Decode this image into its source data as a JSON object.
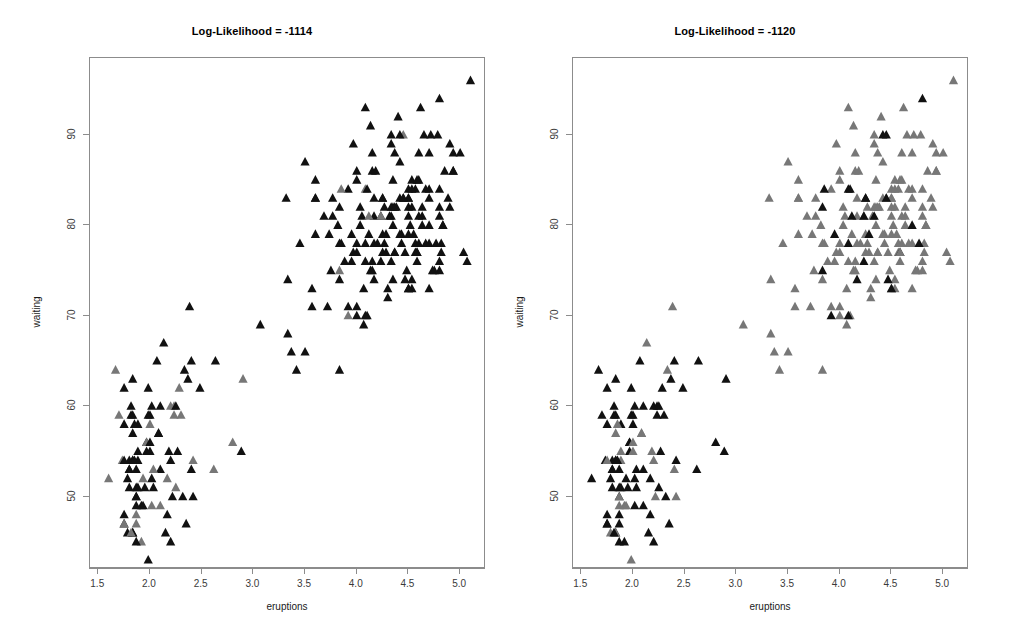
{
  "figure": {
    "width": 1009,
    "height": 643,
    "background": "#ffffff"
  },
  "panels": [
    {
      "id": "left",
      "title": "Log-Likelihood = -1114"
    },
    {
      "id": "right",
      "title": "Log-Likelihood = -1120"
    }
  ],
  "axes": {
    "xlabel": "eruptions",
    "ylabel": "waiting",
    "xticks": [
      "1.5",
      "2.0",
      "2.5",
      "3.0",
      "3.5",
      "4.0",
      "4.5",
      "5.0"
    ],
    "yticks": [
      "50",
      "60",
      "70",
      "80",
      "90"
    ],
    "xlim": [
      1.42,
      5.25
    ],
    "ylim": [
      42.0,
      98.5
    ],
    "frame_color": "#8c8c8c",
    "tick_color": "#8c8c8c",
    "ticklabel_color": "#3a3a3a"
  },
  "marker": {
    "shape": "triangle-up-filled",
    "size_px": 5.0,
    "colors": {
      "dark": "#111111",
      "gray": "#777777"
    }
  },
  "chart_data": {
    "type": "scatter",
    "xlabel": "eruptions",
    "ylabel": "waiting",
    "xlim": [
      1.42,
      5.25
    ],
    "ylim": [
      42.0,
      98.5
    ],
    "grid": false,
    "legend": "none",
    "n_points": 272,
    "panels": [
      {
        "title": "Log-Likelihood = -1114",
        "series": [
          {
            "name": "cluster-dark",
            "color": "#111111"
          },
          {
            "name": "cluster-gray",
            "color": "#777777"
          }
        ]
      },
      {
        "title": "Log-Likelihood = -1120",
        "series": [
          {
            "name": "cluster-dark",
            "color": "#111111"
          },
          {
            "name": "cluster-gray",
            "color": "#777777"
          }
        ]
      }
    ],
    "x": [
      3.6,
      1.8,
      3.333,
      2.283,
      4.533,
      2.883,
      4.7,
      3.6,
      1.95,
      4.35,
      1.833,
      3.917,
      4.2,
      1.75,
      4.7,
      2.167,
      1.75,
      4.8,
      1.6,
      4.25,
      1.8,
      1.75,
      3.45,
      3.067,
      4.533,
      3.6,
      1.967,
      4.083,
      3.85,
      4.433,
      4.3,
      4.467,
      3.367,
      4.033,
      3.833,
      2.017,
      1.867,
      4.833,
      1.833,
      4.783,
      4.35,
      1.883,
      4.567,
      1.75,
      4.533,
      3.317,
      3.833,
      2.1,
      4.633,
      2.0,
      4.8,
      4.716,
      1.833,
      4.833,
      1.733,
      4.883,
      3.717,
      1.667,
      4.567,
      4.317,
      2.233,
      4.5,
      1.75,
      4.8,
      1.817,
      4.4,
      4.167,
      4.7,
      2.067,
      4.7,
      4.033,
      1.967,
      4.5,
      4.0,
      1.983,
      5.067,
      2.017,
      4.567,
      3.883,
      3.6,
      4.133,
      4.333,
      4.1,
      2.633,
      4.067,
      4.933,
      3.95,
      4.517,
      2.167,
      4.0,
      2.2,
      4.333,
      1.867,
      4.817,
      1.833,
      4.3,
      4.667,
      3.75,
      1.867,
      4.9,
      2.483,
      4.367,
      2.1,
      4.5,
      4.05,
      1.867,
      4.7,
      1.783,
      4.85,
      3.683,
      4.733,
      2.3,
      4.9,
      4.417,
      1.7,
      4.633,
      2.317,
      4.6,
      1.817,
      4.417,
      2.617,
      4.067,
      4.25,
      1.967,
      4.6,
      3.767,
      1.917,
      4.5,
      2.267,
      4.65,
      1.867,
      4.167,
      2.8,
      4.333,
      1.833,
      4.383,
      1.883,
      4.933,
      2.033,
      3.733,
      4.233,
      2.233,
      4.533,
      4.817,
      4.333,
      1.983,
      4.633,
      2.017,
      5.1,
      1.8,
      5.033,
      4.0,
      2.4,
      4.6,
      3.567,
      4.0,
      4.5,
      4.083,
      1.8,
      3.967,
      2.2,
      4.15,
      2.0,
      3.833,
      3.5,
      4.583,
      2.367,
      5.0,
      1.933,
      4.617,
      1.917,
      2.083,
      4.583,
      3.333,
      4.167,
      4.333,
      4.5,
      2.417,
      4.0,
      4.167,
      1.883,
      4.583,
      4.25,
      3.767,
      2.033,
      4.433,
      4.083,
      1.833,
      4.417,
      2.183,
      4.8,
      1.833,
      4.8,
      4.1,
      3.966,
      4.233,
      3.5,
      4.366,
      2.25,
      4.667,
      2.1,
      4.35,
      4.133,
      1.867,
      4.6,
      1.783,
      4.367,
      3.85,
      1.933,
      4.5,
      2.383,
      4.7,
      1.867,
      3.833,
      3.417,
      4.233,
      2.4,
      4.8,
      2.0,
      4.15,
      1.867,
      4.267,
      1.75,
      4.483,
      4.0,
      4.117,
      4.083,
      4.267,
      3.917,
      4.55,
      4.083,
      2.417,
      4.183,
      2.217,
      4.45,
      1.883,
      1.85,
      4.283,
      3.95,
      2.333,
      4.15,
      2.35,
      4.933,
      2.9,
      4.583,
      3.833,
      2.083,
      4.367,
      2.133,
      4.35,
      2.2,
      4.45,
      3.567,
      4.5,
      4.15,
      3.817,
      3.917,
      4.45,
      2.0,
      4.283,
      4.767,
      4.533,
      1.85,
      4.25,
      1.983,
      2.25,
      4.75,
      4.117,
      2.15,
      4.417,
      1.817,
      4.467
    ],
    "y": [
      79,
      54,
      74,
      62,
      85,
      55,
      88,
      85,
      51,
      85,
      54,
      84,
      78,
      47,
      83,
      52,
      62,
      84,
      52,
      79,
      51,
      47,
      78,
      69,
      74,
      83,
      55,
      76,
      78,
      79,
      73,
      77,
      66,
      80,
      74,
      52,
      48,
      80,
      59,
      90,
      80,
      58,
      84,
      58,
      73,
      83,
      64,
      53,
      82,
      59,
      75,
      90,
      54,
      80,
      54,
      83,
      71,
      64,
      77,
      81,
      59,
      84,
      48,
      82,
      60,
      92,
      78,
      78,
      65,
      73,
      82,
      56,
      79,
      71,
      62,
      76,
      60,
      78,
      76,
      83,
      75,
      82,
      70,
      65,
      73,
      88,
      76,
      80,
      48,
      86,
      60,
      90,
      50,
      78,
      63,
      72,
      84,
      75,
      51,
      82,
      62,
      88,
      49,
      83,
      81,
      47,
      84,
      52,
      86,
      81,
      75,
      59,
      89,
      79,
      59,
      81,
      50,
      85,
      59,
      87,
      53,
      69,
      77,
      56,
      88,
      81,
      45,
      82,
      55,
      90,
      45,
      83,
      56,
      89,
      46,
      82,
      51,
      86,
      53,
      79,
      81,
      60,
      82,
      77,
      76,
      59,
      80,
      49,
      96,
      53,
      77,
      77,
      65,
      81,
      71,
      70,
      81,
      93,
      53,
      89,
      45,
      86,
      58,
      78,
      66,
      76,
      63,
      88,
      52,
      93,
      49,
      57,
      77,
      68,
      81,
      81,
      73,
      50,
      85,
      74,
      55,
      77,
      83,
      83,
      51,
      78,
      84,
      46,
      83,
      55,
      81,
      57,
      76,
      84,
      77,
      81,
      87,
      77,
      51,
      78,
      60,
      82,
      91,
      53,
      78,
      46,
      77,
      84,
      49,
      83,
      71,
      80,
      49,
      75,
      64,
      76,
      53,
      94,
      55,
      76,
      50,
      82,
      54,
      75,
      78,
      79,
      78,
      78,
      70,
      79,
      70,
      54,
      86,
      50,
      90,
      54,
      54,
      77,
      79,
      64,
      75,
      47,
      86,
      63,
      85,
      82,
      57,
      82,
      67,
      74,
      54,
      83,
      73,
      73,
      88,
      80,
      71,
      83,
      56,
      79,
      78,
      84,
      58,
      83,
      43,
      60,
      75,
      81,
      46,
      90,
      46,
      74
    ],
    "cluster_left": [
      1,
      0,
      1,
      0,
      1,
      1,
      1,
      1,
      0,
      1,
      0,
      1,
      1,
      0,
      1,
      0,
      0,
      1,
      0,
      1,
      0,
      0,
      1,
      1,
      1,
      1,
      0,
      1,
      1,
      1,
      1,
      1,
      1,
      1,
      1,
      0,
      0,
      1,
      0,
      1,
      1,
      0,
      1,
      0,
      1,
      1,
      1,
      0,
      1,
      0,
      1,
      1,
      0,
      1,
      0,
      1,
      1,
      0,
      1,
      1,
      0,
      1,
      0,
      1,
      0,
      1,
      1,
      1,
      0,
      1,
      1,
      0,
      1,
      1,
      0,
      1,
      0,
      1,
      1,
      1,
      1,
      1,
      1,
      0,
      1,
      1,
      1,
      1,
      0,
      1,
      0,
      1,
      0,
      1,
      0,
      1,
      1,
      1,
      0,
      1,
      0,
      1,
      0,
      1,
      1,
      0,
      1,
      0,
      1,
      1,
      1,
      0,
      1,
      1,
      0,
      1,
      0,
      1,
      0,
      1,
      0,
      1,
      1,
      0,
      1,
      1,
      0,
      1,
      0,
      1,
      0,
      1,
      0,
      1,
      0,
      1,
      0,
      1,
      0,
      1,
      1,
      0,
      1,
      1,
      1,
      0,
      1,
      0,
      1,
      0,
      1,
      1,
      0,
      1,
      1,
      1,
      1,
      1,
      0,
      1,
      0,
      1,
      0,
      1,
      1,
      1,
      0,
      1,
      0,
      1,
      1,
      1,
      0,
      1,
      1,
      0,
      1,
      1,
      1,
      0,
      1,
      1,
      0,
      1,
      0,
      1,
      0,
      1,
      1,
      1,
      1,
      1,
      1,
      0,
      1,
      0,
      1,
      1,
      0,
      1,
      0,
      1,
      1,
      0,
      1,
      1,
      1,
      0,
      1,
      1,
      1,
      0,
      1,
      0,
      1,
      0,
      1,
      0,
      1,
      1,
      1,
      1,
      1,
      1,
      1,
      1,
      0,
      1,
      0,
      1,
      0,
      0,
      1,
      1,
      0,
      1,
      0,
      1,
      1,
      1,
      1,
      0,
      1,
      0,
      1,
      0,
      1,
      1,
      1,
      1,
      1,
      1,
      1,
      0,
      1,
      1,
      1,
      0,
      1,
      0,
      0,
      1,
      1,
      0,
      1,
      0,
      1
    ],
    "cluster_right": [
      1,
      0,
      1,
      0,
      1,
      0,
      1,
      1,
      0,
      1,
      0,
      1,
      1,
      0,
      1,
      0,
      0,
      1,
      0,
      1,
      0,
      0,
      1,
      1,
      1,
      1,
      0,
      1,
      1,
      1,
      1,
      1,
      1,
      1,
      1,
      0,
      0,
      1,
      0,
      1,
      1,
      0,
      1,
      0,
      1,
      1,
      1,
      0,
      1,
      0,
      1,
      1,
      0,
      1,
      0,
      1,
      1,
      0,
      1,
      1,
      0,
      1,
      0,
      1,
      0,
      1,
      1,
      1,
      0,
      1,
      1,
      0,
      1,
      1,
      0,
      1,
      0,
      1,
      1,
      1,
      1,
      1,
      1,
      0,
      1,
      1,
      1,
      1,
      0,
      1,
      0,
      1,
      0,
      1,
      0,
      1,
      1,
      1,
      0,
      1,
      0,
      1,
      0,
      1,
      1,
      0,
      1,
      0,
      1,
      1,
      1,
      0,
      1,
      1,
      0,
      1,
      0,
      1,
      0,
      1,
      0,
      1,
      1,
      0,
      1,
      1,
      0,
      1,
      0,
      1,
      0,
      1,
      0,
      1,
      0,
      1,
      0,
      1,
      0,
      1,
      1,
      0,
      1,
      1,
      1,
      0,
      1,
      0,
      1,
      0,
      1,
      1,
      0,
      1,
      1,
      1,
      1,
      1,
      0,
      1,
      0,
      1,
      0,
      1,
      1,
      1,
      0,
      1,
      0,
      1,
      1,
      1,
      0,
      1,
      1,
      0,
      1,
      1,
      1,
      0,
      1,
      1,
      0,
      1,
      0,
      1,
      0,
      1,
      1,
      1,
      1,
      1,
      1,
      0,
      1,
      0,
      1,
      1,
      0,
      1,
      0,
      1,
      1,
      0,
      1,
      1,
      1,
      0,
      1,
      1,
      1,
      0,
      1,
      0,
      1,
      0,
      1,
      0,
      1,
      1,
      1,
      1,
      1,
      1,
      1,
      1,
      0,
      1,
      0,
      1,
      0,
      0,
      1,
      1,
      0,
      1,
      0,
      1,
      0,
      1,
      1,
      0,
      1,
      0,
      1,
      0,
      1,
      1,
      1,
      1,
      1,
      1,
      1,
      0,
      1,
      1,
      1,
      0,
      1,
      0,
      0,
      1,
      1,
      0,
      1,
      0,
      1
    ]
  }
}
